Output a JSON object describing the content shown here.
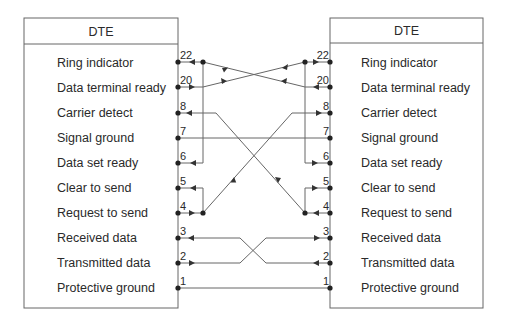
{
  "diagram": {
    "type": "null-modem-wiring",
    "left": {
      "title": "DTE",
      "signals": [
        {
          "pin": "22",
          "label": "Ring indicator"
        },
        {
          "pin": "20",
          "label": "Data terminal ready"
        },
        {
          "pin": "8",
          "label": "Carrier detect"
        },
        {
          "pin": "7",
          "label": "Signal ground"
        },
        {
          "pin": "6",
          "label": "Data set ready"
        },
        {
          "pin": "5",
          "label": "Clear to send"
        },
        {
          "pin": "4",
          "label": "Request to send"
        },
        {
          "pin": "3",
          "label": "Received data"
        },
        {
          "pin": "2",
          "label": "Transmitted data"
        },
        {
          "pin": "1",
          "label": "Protective ground"
        }
      ]
    },
    "right": {
      "title": "DTE",
      "signals": [
        {
          "pin": "22",
          "label": "Ring indicator"
        },
        {
          "pin": "20",
          "label": "Data terminal ready"
        },
        {
          "pin": "8",
          "label": "Carrier detect"
        },
        {
          "pin": "7",
          "label": "Signal ground"
        },
        {
          "pin": "6",
          "label": "Data set ready"
        },
        {
          "pin": "5",
          "label": "Clear to send"
        },
        {
          "pin": "4",
          "label": "Request to send"
        },
        {
          "pin": "3",
          "label": "Received data"
        },
        {
          "pin": "2",
          "label": "Transmitted data"
        },
        {
          "pin": "1",
          "label": "Protective ground"
        }
      ]
    },
    "connections": [
      {
        "from": "L20",
        "to": [
          "R22",
          "R6",
          "R8"
        ],
        "note": "left DTR drives right RI, DSR, CD"
      },
      {
        "from": "R20",
        "to": [
          "L22",
          "L6",
          "L8"
        ],
        "note": "right DTR drives left RI, DSR, CD"
      },
      {
        "from": "L4",
        "to": [
          "L5",
          "R8"
        ],
        "note": "left RTS loops to left CTS and crosses to right CD"
      },
      {
        "from": "R4",
        "to": [
          "R5",
          "L8"
        ],
        "note": "right RTS loops to right CTS and crosses to left CD"
      },
      {
        "from": "L2",
        "to": [
          "R3"
        ]
      },
      {
        "from": "R2",
        "to": [
          "L3"
        ]
      },
      {
        "from": "L7",
        "to": [
          "R7"
        ]
      },
      {
        "from": "L1",
        "to": [
          "R1"
        ]
      }
    ],
    "colors": {
      "line": "#555555",
      "text": "#2a2a2a"
    }
  }
}
